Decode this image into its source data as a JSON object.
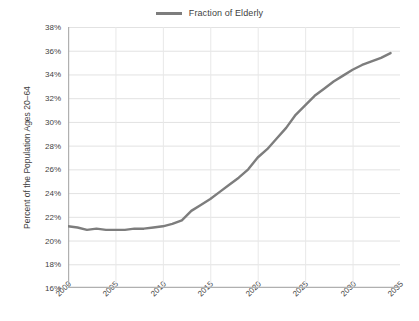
{
  "chart_data": {
    "type": "line",
    "title": "",
    "xlabel": "",
    "ylabel": "Percent of the Population Ages 20–64",
    "xlim": [
      2000,
      2035
    ],
    "ylim": [
      16,
      38
    ],
    "grid": true,
    "legend_position": "top-center",
    "y_tick_labels": [
      "38%",
      "36%",
      "34%",
      "32%",
      "30%",
      "28%",
      "26%",
      "24%",
      "22%",
      "20%",
      "18%",
      "16%"
    ],
    "y_tick_values": [
      38,
      36,
      34,
      32,
      30,
      28,
      26,
      24,
      22,
      20,
      18,
      16
    ],
    "x_tick_labels": [
      "2000",
      "2005",
      "2010",
      "2015",
      "2020",
      "2025",
      "2030",
      "2035"
    ],
    "x_tick_values": [
      2000,
      2005,
      2010,
      2015,
      2020,
      2025,
      2030,
      2035
    ],
    "series": [
      {
        "name": "Fraction of Elderly",
        "color": "#7d7d7d",
        "x": [
          2000,
          2001,
          2002,
          2003,
          2004,
          2005,
          2006,
          2007,
          2008,
          2009,
          2010,
          2011,
          2012,
          2013,
          2014,
          2015,
          2016,
          2017,
          2018,
          2019,
          2020,
          2021,
          2022,
          2023,
          2024,
          2025,
          2026,
          2027,
          2028,
          2029,
          2030,
          2031,
          2032,
          2033,
          2034
        ],
        "values": [
          21.2,
          21.1,
          20.9,
          21.0,
          20.9,
          20.9,
          20.9,
          21.0,
          21.0,
          21.1,
          21.2,
          21.4,
          21.7,
          22.5,
          23.0,
          23.5,
          24.1,
          24.7,
          25.3,
          26.0,
          27.0,
          27.7,
          28.6,
          29.5,
          30.6,
          31.4,
          32.2,
          32.8,
          33.4,
          33.9,
          34.4,
          34.8,
          35.1,
          35.4,
          35.8
        ]
      }
    ]
  },
  "legend": {
    "entries": [
      {
        "label": "Fraction of Elderly",
        "color": "#7d7d7d"
      }
    ]
  },
  "axis": {
    "y_title": "Percent of the Population Ages 20–64"
  }
}
